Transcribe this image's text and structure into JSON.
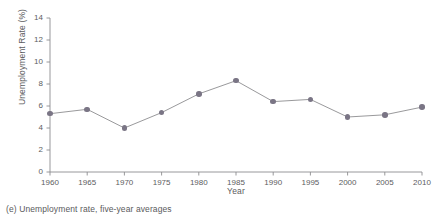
{
  "chart_data": {
    "type": "line",
    "title": "",
    "xlabel": "Year",
    "ylabel": "Unemployment Rate (%)",
    "xlim": [
      1960,
      2010
    ],
    "ylim": [
      0,
      14
    ],
    "grid": false,
    "legend": "none",
    "xticks": [
      "1960",
      "1965",
      "1970",
      "1975",
      "1980",
      "1985",
      "1990",
      "1995",
      "2000",
      "2005",
      "2010"
    ],
    "yticks": [
      "0",
      "2",
      "4",
      "6",
      "8",
      "10",
      "12",
      "14"
    ],
    "x": [
      1960,
      1965,
      1970,
      1975,
      1980,
      1985,
      1990,
      1995,
      2000,
      2005,
      2010
    ],
    "values": [
      5.3,
      5.7,
      4.0,
      5.4,
      7.1,
      8.3,
      6.4,
      6.6,
      5.0,
      5.2,
      5.9
    ],
    "series": [
      {
        "name": "Unemployment rate, five-year averages",
        "values": [
          5.3,
          5.7,
          4.0,
          5.4,
          7.1,
          8.3,
          6.4,
          6.6,
          5.0,
          5.2,
          5.9
        ]
      }
    ],
    "marker_color": "#7a7585",
    "line_color": "#8d8d90",
    "axis_color": "#8d8d90"
  },
  "caption": {
    "text": "(e) Unemployment rate, five-year averages"
  }
}
